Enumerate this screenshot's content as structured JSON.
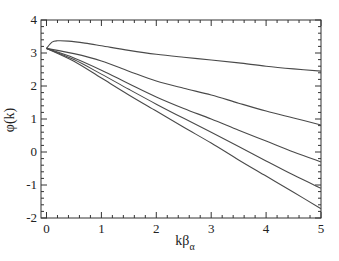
{
  "chart_data": {
    "type": "line",
    "title": "",
    "xlabel": "kβα",
    "xlabel_main": "kβ",
    "xlabel_sub": "α",
    "ylabel": "φ(k)",
    "xlim": [
      -0.1,
      5
    ],
    "ylim": [
      -2,
      4
    ],
    "xticks": [
      0,
      1,
      2,
      3,
      4,
      5
    ],
    "yticks": [
      -2,
      -1,
      0,
      1,
      2,
      3,
      4
    ],
    "grid": false,
    "legend": null,
    "line_color": "#4a4a4a",
    "series": [
      {
        "name": "curve-1",
        "x": [
          0,
          0.1,
          0.2,
          0.4,
          0.7,
          1,
          1.5,
          2,
          2.5,
          3,
          3.5,
          4,
          4.5,
          5
        ],
        "y": [
          3.14,
          3.33,
          3.37,
          3.36,
          3.3,
          3.22,
          3.08,
          2.96,
          2.87,
          2.79,
          2.7,
          2.6,
          2.52,
          2.45
        ]
      },
      {
        "name": "curve-2",
        "x": [
          0,
          0.5,
          1,
          1.5,
          2,
          2.5,
          3,
          3.5,
          4,
          4.5,
          5
        ],
        "y": [
          3.14,
          2.98,
          2.76,
          2.45,
          2.15,
          1.93,
          1.73,
          1.48,
          1.24,
          1.03,
          0.82
        ]
      },
      {
        "name": "curve-3",
        "x": [
          0,
          0.5,
          1,
          1.5,
          2,
          2.5,
          3,
          3.5,
          4,
          4.5,
          5
        ],
        "y": [
          3.14,
          2.85,
          2.48,
          2.07,
          1.67,
          1.32,
          1.0,
          0.66,
          0.33,
          0.0,
          -0.3
        ]
      },
      {
        "name": "curve-4",
        "x": [
          0,
          0.5,
          1,
          1.5,
          2,
          2.5,
          3,
          3.5,
          4,
          4.5,
          5
        ],
        "y": [
          3.14,
          2.8,
          2.36,
          1.9,
          1.45,
          1.02,
          0.6,
          0.17,
          -0.27,
          -0.7,
          -1.1
        ]
      },
      {
        "name": "curve-5",
        "x": [
          0,
          0.5,
          1,
          1.5,
          2,
          2.5,
          3,
          3.5,
          4,
          4.5,
          5
        ],
        "y": [
          3.14,
          2.75,
          2.24,
          1.73,
          1.24,
          0.75,
          0.27,
          -0.24,
          -0.73,
          -1.22,
          -1.72
        ]
      }
    ]
  }
}
